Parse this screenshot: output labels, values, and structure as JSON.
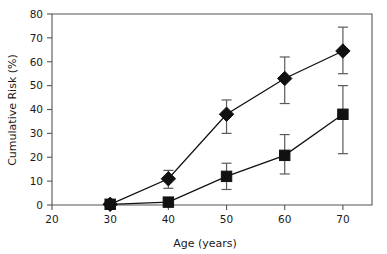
{
  "chart_data": {
    "type": "line",
    "title": "",
    "xlabel": "Age (years)",
    "ylabel": "Cumulative Risk (%)",
    "xlim": [
      20,
      75
    ],
    "ylim": [
      0,
      80
    ],
    "xticks": [
      20,
      30,
      40,
      50,
      60,
      70
    ],
    "yticks": [
      0,
      10,
      20,
      30,
      40,
      50,
      60,
      70,
      80
    ],
    "grid": false,
    "legend": "none",
    "x": [
      30,
      40,
      50,
      60,
      70
    ],
    "series": [
      {
        "name": "diamond-series",
        "marker": "diamond",
        "color": "#111111",
        "x": [
          30,
          40,
          50,
          60,
          70
        ],
        "values": [
          0.3,
          11.0,
          38.0,
          53.0,
          64.5
        ],
        "err_low": [
          0.3,
          7.0,
          30.0,
          42.5,
          55.0
        ],
        "err_high": [
          0.3,
          14.5,
          44.0,
          62.0,
          74.5
        ]
      },
      {
        "name": "square-series",
        "marker": "square",
        "color": "#111111",
        "x": [
          30,
          40,
          50,
          60,
          70
        ],
        "values": [
          0.3,
          1.2,
          12.0,
          20.8,
          38.0
        ],
        "err_low": [
          0.3,
          1.2,
          6.5,
          13.0,
          21.5
        ],
        "err_high": [
          0.3,
          1.2,
          17.5,
          29.5,
          50.0
        ]
      }
    ]
  },
  "axis": {
    "x_tick_labels": [
      "20",
      "30",
      "40",
      "50",
      "60",
      "70"
    ],
    "y_tick_labels": [
      "0",
      "10",
      "20",
      "30",
      "40",
      "50",
      "60",
      "70",
      "80"
    ],
    "x_title": "Age (years)",
    "y_title": "Cumulative Risk (%)"
  }
}
